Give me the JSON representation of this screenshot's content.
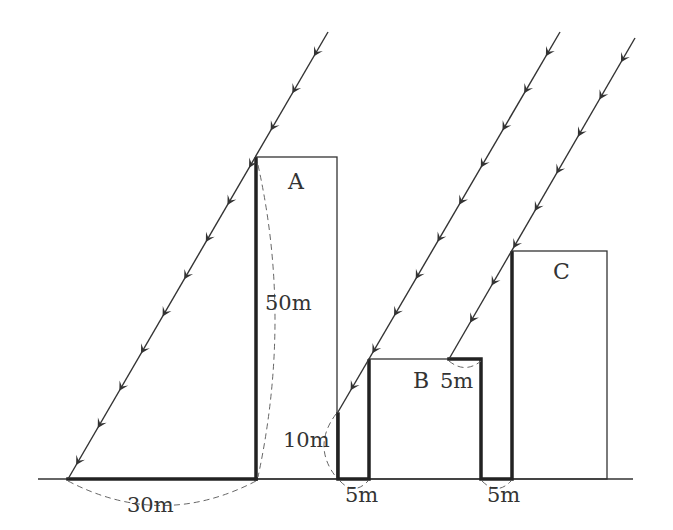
{
  "diagram": {
    "colors": {
      "line": "#333333",
      "dashed": "#666666",
      "background": "#ffffff"
    },
    "ground": {
      "x1": 38,
      "x2": 633,
      "y": 479
    },
    "buildings": [
      {
        "id": "A",
        "label": "A",
        "x": 256,
        "top": 157,
        "right": 337,
        "label_x": 297,
        "label_y": 189
      },
      {
        "id": "B",
        "label": "B",
        "x": 369,
        "top": 359,
        "right": 481,
        "label_x": 422,
        "label_y": 388
      },
      {
        "id": "C",
        "label": "C",
        "x": 512,
        "top": 251,
        "right": 607,
        "label_x": 562,
        "label_y": 279
      }
    ],
    "rays": [
      {
        "name": "ray-1",
        "x1": 328,
        "y1": 32,
        "x2": 68,
        "y2": 479
      },
      {
        "name": "ray-2",
        "x1": 560,
        "y1": 32,
        "x2": 338,
        "y2": 412
      },
      {
        "name": "ray-3",
        "x1": 635,
        "y1": 38,
        "x2": 449,
        "y2": 359
      }
    ],
    "labels": {
      "a_height": "50m",
      "a_shadow": "30m",
      "a_shadow_on_wall": "10m",
      "gap_ab": "5m",
      "b_roof_shadow": "5m",
      "gap_bc": "5m"
    }
  }
}
